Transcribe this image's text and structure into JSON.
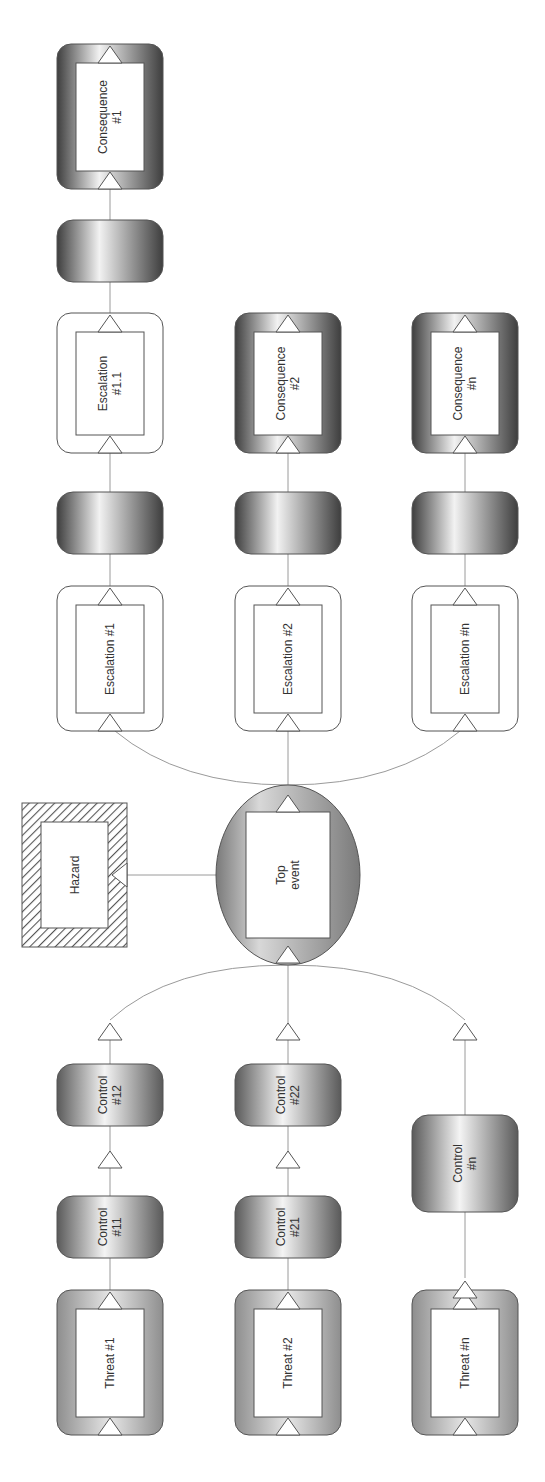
{
  "diagram": {
    "orientation": "rotated-90-ccw",
    "colors": {
      "outline": "#555555",
      "edge": "#9a9a9a",
      "consequence_dark": "#4a4a4a",
      "control_dark": "#6a6a6a",
      "threat_fill": "#a9a9a9",
      "topevent_fill": "#8f8f8f",
      "escalation_fill": "#ffffff",
      "hazard_hatch": "#555555"
    },
    "hazard": {
      "id": "hazard",
      "label": [
        "Hazard"
      ],
      "box": [
        22,
        803,
        105,
        144
      ]
    },
    "top_event": {
      "id": "top-event",
      "label": [
        "Top",
        "event"
      ],
      "cx": 288,
      "cy": 875,
      "rx": 72,
      "ry": 90
    },
    "threats": [
      {
        "id": "threat-1",
        "label": [
          "Threat #1"
        ],
        "box": [
          57,
          1290,
          106,
          145
        ]
      },
      {
        "id": "threat-2",
        "label": [
          "Threat #2"
        ],
        "box": [
          235,
          1290,
          106,
          145
        ]
      },
      {
        "id": "threat-n",
        "label": [
          "Threat #n"
        ],
        "box": [
          412,
          1290,
          106,
          145
        ]
      }
    ],
    "controls": [
      {
        "id": "control-11",
        "label": [
          "Control",
          "#11"
        ],
        "box": [
          57,
          1196,
          106,
          62
        ]
      },
      {
        "id": "control-12",
        "label": [
          "Control",
          "#12"
        ],
        "box": [
          57,
          1064,
          106,
          62
        ]
      },
      {
        "id": "control-21",
        "label": [
          "Control",
          "#21"
        ],
        "box": [
          235,
          1196,
          106,
          62
        ]
      },
      {
        "id": "control-22",
        "label": [
          "Control",
          "#22"
        ],
        "box": [
          235,
          1064,
          106,
          62
        ]
      },
      {
        "id": "control-n",
        "label": [
          "Control",
          "#n"
        ],
        "box": [
          412,
          1115,
          106,
          97
        ]
      }
    ],
    "escalations": [
      {
        "id": "escalation-1",
        "label": [
          "Escalation #1"
        ],
        "box": [
          57,
          586,
          106,
          145
        ]
      },
      {
        "id": "escalation-1-1",
        "label": [
          "Escalation",
          "#1.1"
        ],
        "box": [
          57,
          313,
          106,
          140
        ]
      },
      {
        "id": "escalation-2",
        "label": [
          "Escalation #2"
        ],
        "box": [
          235,
          586,
          106,
          145
        ]
      },
      {
        "id": "escalation-n",
        "label": [
          "Escalation #n"
        ],
        "box": [
          412,
          586,
          106,
          145
        ]
      }
    ],
    "recovery_barriers": [
      {
        "id": "barrier-1",
        "box": [
          57,
          220,
          106,
          62
        ]
      },
      {
        "id": "barrier-2",
        "box": [
          57,
          492,
          106,
          62
        ]
      },
      {
        "id": "barrier-3",
        "box": [
          235,
          492,
          106,
          62
        ]
      },
      {
        "id": "barrier-4",
        "box": [
          412,
          492,
          106,
          62
        ]
      }
    ],
    "consequences": [
      {
        "id": "consequence-1",
        "label": [
          "Consequence",
          "#1"
        ],
        "box": [
          57,
          44,
          106,
          145
        ]
      },
      {
        "id": "consequence-2",
        "label": [
          "Consequence",
          "#2"
        ],
        "box": [
          235,
          313,
          106,
          140
        ]
      },
      {
        "id": "consequence-n",
        "label": [
          "Consequence",
          "#n"
        ],
        "box": [
          412,
          313,
          106,
          140
        ]
      }
    ],
    "standalone_triangles": [
      {
        "x": 110,
        "y": 1020
      },
      {
        "x": 110,
        "y": 1148
      },
      {
        "x": 288,
        "y": 1020
      },
      {
        "x": 288,
        "y": 1148
      },
      {
        "x": 465,
        "y": 1020
      },
      {
        "x": 465,
        "y": 1278
      }
    ]
  }
}
